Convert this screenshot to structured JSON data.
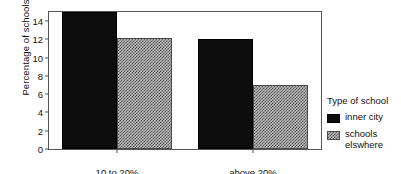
{
  "chart_data": {
    "type": "bar",
    "title": "",
    "subtitle": "",
    "xlabel": "",
    "ylabel": "Percentage of schools",
    "categories": [
      "10 to 20%",
      "above 20%"
    ],
    "series": [
      {
        "name": "inner city",
        "values": [
          15,
          12
        ],
        "color": "#0d0d0d",
        "pattern": "solid"
      },
      {
        "name": "schools elswhere",
        "values": [
          12.2,
          7
        ],
        "color": "#b8b8b8",
        "pattern": "checkered"
      }
    ],
    "ylim": [
      0,
      15
    ],
    "yticks": [
      0,
      2,
      4,
      6,
      8,
      10,
      12,
      14
    ],
    "ytick_labels": [
      "0",
      "2",
      "4",
      "6",
      "8",
      "10",
      "12",
      "14"
    ],
    "grid": false,
    "legend_position": "right",
    "legend_title": "Type of school",
    "bar_group_mode": "grouped",
    "frame": true
  },
  "legend": {
    "title": "Type of school",
    "entries": [
      {
        "label": "inner city"
      },
      {
        "label": "schools elswhere"
      }
    ]
  },
  "axes": {
    "y_title": "Percentage of schools"
  }
}
